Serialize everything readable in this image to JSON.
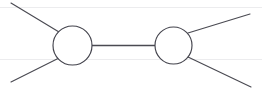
{
  "canvas": {
    "width": 262,
    "height": 91,
    "background": "#ffffff",
    "title": "two-vertex scattering diagram"
  },
  "style": {
    "stroke_color": "#4a4a52",
    "blob_stroke_color": "#43434c",
    "blob_fill": "#ffffff",
    "rule_color": "#ececee",
    "line_width": 1.15,
    "propagator_width": 1.3
  },
  "paper_rules": [
    {
      "name": "rule-top",
      "y": 7.5
    },
    {
      "name": "rule-bottom",
      "y": 59.5
    }
  ],
  "blobs": [
    {
      "name": "left-vertex-blob",
      "cx": 72.5,
      "cy": 45.5,
      "r": 19.5
    },
    {
      "name": "right-vertex-blob",
      "cx": 173.5,
      "cy": 45.5,
      "r": 18.5
    }
  ],
  "propagator": {
    "name": "internal-propagator",
    "x1": 92,
    "y1": 45.5,
    "x2": 155,
    "y2": 45.5
  },
  "legs": [
    {
      "name": "leg-upper-left",
      "x1": 11,
      "y1": 3,
      "x2": 59,
      "y2": 32
    },
    {
      "name": "leg-lower-left",
      "x1": 11,
      "y1": 82,
      "x2": 59,
      "y2": 58
    },
    {
      "name": "leg-upper-right",
      "x1": 188,
      "y1": 33,
      "x2": 250,
      "y2": 14
    },
    {
      "name": "leg-lower-right",
      "x1": 188,
      "y1": 57,
      "x2": 251,
      "y2": 87
    }
  ]
}
